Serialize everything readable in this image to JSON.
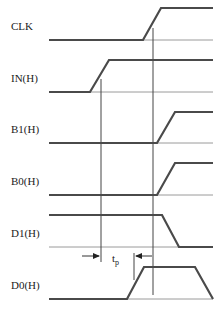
{
  "diagram": {
    "title": "",
    "signals": [
      {
        "name": "CLK",
        "label": "CLK",
        "label_y": 30,
        "low_y": 40,
        "high_y": 8,
        "points": "49,40 143,40 161,8 213,8"
      },
      {
        "name": "IN(H)",
        "label": "IN(H)",
        "label_y": 82,
        "low_y": 92,
        "high_y": 60,
        "points": "49,92 90,92 109,60 213,60"
      },
      {
        "name": "B1(H)",
        "label": "B1(H)",
        "label_y": 133,
        "low_y": 143,
        "high_y": 112,
        "points": "49,143 157,143 175,112 213,112"
      },
      {
        "name": "B0(H)",
        "label": "B0(H)",
        "label_y": 185,
        "low_y": 195,
        "high_y": 163,
        "points": "49,195 157,195 175,163 213,163"
      },
      {
        "name": "D1(H)",
        "label": "D1(H)",
        "label_y": 237,
        "low_y": 247,
        "high_y": 215,
        "points": "49,215 162,215 179,247 213,247"
      },
      {
        "name": "D0(H)",
        "label": "D0(H)",
        "label_y": 289,
        "low_y": 299,
        "high_y": 267,
        "points": "49,299 127,299 144,267 195,267 213,299"
      }
    ],
    "markers": {
      "input_edge_line_x": 101,
      "clock_edge_line_x": 153,
      "output_edge_tick_x": 134
    },
    "annotation": {
      "symbol": "t",
      "subscript": "p",
      "meaning": "propagation delay"
    }
  }
}
